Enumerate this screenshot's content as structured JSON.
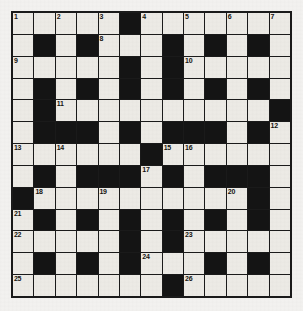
{
  "puzzle": {
    "type": "crossword-grid",
    "rows": 13,
    "columns": 13,
    "colors": {
      "white_cell": "#eceae5",
      "black_cell": "#141414",
      "grid_line": "#1a1a1a",
      "page_background": "#f2f1ef",
      "number_text": "#15130f"
    },
    "cells": [
      [
        {
          "block": false,
          "number": "1"
        },
        {
          "block": false,
          "number": ""
        },
        {
          "block": false,
          "number": "2"
        },
        {
          "block": false,
          "number": ""
        },
        {
          "block": false,
          "number": "3"
        },
        {
          "block": true,
          "number": ""
        },
        {
          "block": false,
          "number": "4"
        },
        {
          "block": false,
          "number": ""
        },
        {
          "block": false,
          "number": "5"
        },
        {
          "block": false,
          "number": ""
        },
        {
          "block": false,
          "number": "6"
        },
        {
          "block": false,
          "number": ""
        },
        {
          "block": false,
          "number": "7"
        }
      ],
      [
        {
          "block": false,
          "number": ""
        },
        {
          "block": true,
          "number": ""
        },
        {
          "block": false,
          "number": ""
        },
        {
          "block": true,
          "number": ""
        },
        {
          "block": false,
          "number": "8"
        },
        {
          "block": false,
          "number": ""
        },
        {
          "block": false,
          "number": ""
        },
        {
          "block": true,
          "number": ""
        },
        {
          "block": false,
          "number": ""
        },
        {
          "block": true,
          "number": ""
        },
        {
          "block": false,
          "number": ""
        },
        {
          "block": true,
          "number": ""
        },
        {
          "block": false,
          "number": ""
        }
      ],
      [
        {
          "block": false,
          "number": "9"
        },
        {
          "block": false,
          "number": ""
        },
        {
          "block": false,
          "number": ""
        },
        {
          "block": false,
          "number": ""
        },
        {
          "block": false,
          "number": ""
        },
        {
          "block": true,
          "number": ""
        },
        {
          "block": false,
          "number": ""
        },
        {
          "block": true,
          "number": ""
        },
        {
          "block": false,
          "number": "10"
        },
        {
          "block": false,
          "number": ""
        },
        {
          "block": false,
          "number": ""
        },
        {
          "block": false,
          "number": ""
        },
        {
          "block": false,
          "number": ""
        }
      ],
      [
        {
          "block": false,
          "number": ""
        },
        {
          "block": true,
          "number": ""
        },
        {
          "block": false,
          "number": ""
        },
        {
          "block": true,
          "number": ""
        },
        {
          "block": false,
          "number": ""
        },
        {
          "block": true,
          "number": ""
        },
        {
          "block": false,
          "number": ""
        },
        {
          "block": true,
          "number": ""
        },
        {
          "block": false,
          "number": ""
        },
        {
          "block": true,
          "number": ""
        },
        {
          "block": false,
          "number": ""
        },
        {
          "block": true,
          "number": ""
        },
        {
          "block": false,
          "number": ""
        }
      ],
      [
        {
          "block": false,
          "number": ""
        },
        {
          "block": true,
          "number": ""
        },
        {
          "block": false,
          "number": "11"
        },
        {
          "block": false,
          "number": ""
        },
        {
          "block": false,
          "number": ""
        },
        {
          "block": false,
          "number": ""
        },
        {
          "block": false,
          "number": ""
        },
        {
          "block": false,
          "number": ""
        },
        {
          "block": false,
          "number": ""
        },
        {
          "block": false,
          "number": ""
        },
        {
          "block": false,
          "number": ""
        },
        {
          "block": false,
          "number": ""
        },
        {
          "block": true,
          "number": ""
        }
      ],
      [
        {
          "block": false,
          "number": ""
        },
        {
          "block": true,
          "number": ""
        },
        {
          "block": true,
          "number": ""
        },
        {
          "block": true,
          "number": ""
        },
        {
          "block": false,
          "number": ""
        },
        {
          "block": true,
          "number": ""
        },
        {
          "block": false,
          "number": ""
        },
        {
          "block": true,
          "number": ""
        },
        {
          "block": true,
          "number": ""
        },
        {
          "block": true,
          "number": ""
        },
        {
          "block": false,
          "number": ""
        },
        {
          "block": true,
          "number": ""
        },
        {
          "block": false,
          "number": "12"
        }
      ],
      [
        {
          "block": false,
          "number": "13"
        },
        {
          "block": false,
          "number": ""
        },
        {
          "block": false,
          "number": "14"
        },
        {
          "block": false,
          "number": ""
        },
        {
          "block": false,
          "number": ""
        },
        {
          "block": false,
          "number": ""
        },
        {
          "block": true,
          "number": ""
        },
        {
          "block": false,
          "number": "15"
        },
        {
          "block": false,
          "number": "16"
        },
        {
          "block": false,
          "number": ""
        },
        {
          "block": false,
          "number": ""
        },
        {
          "block": false,
          "number": ""
        },
        {
          "block": false,
          "number": ""
        }
      ],
      [
        {
          "block": false,
          "number": ""
        },
        {
          "block": true,
          "number": ""
        },
        {
          "block": false,
          "number": ""
        },
        {
          "block": true,
          "number": ""
        },
        {
          "block": true,
          "number": ""
        },
        {
          "block": true,
          "number": ""
        },
        {
          "block": false,
          "number": "17"
        },
        {
          "block": true,
          "number": ""
        },
        {
          "block": false,
          "number": ""
        },
        {
          "block": true,
          "number": ""
        },
        {
          "block": true,
          "number": ""
        },
        {
          "block": true,
          "number": ""
        },
        {
          "block": false,
          "number": ""
        }
      ],
      [
        {
          "block": true,
          "number": ""
        },
        {
          "block": false,
          "number": "18"
        },
        {
          "block": false,
          "number": ""
        },
        {
          "block": false,
          "number": ""
        },
        {
          "block": false,
          "number": "19"
        },
        {
          "block": false,
          "number": ""
        },
        {
          "block": false,
          "number": ""
        },
        {
          "block": false,
          "number": ""
        },
        {
          "block": false,
          "number": ""
        },
        {
          "block": false,
          "number": ""
        },
        {
          "block": false,
          "number": "20"
        },
        {
          "block": true,
          "number": ""
        },
        {
          "block": false,
          "number": ""
        }
      ],
      [
        {
          "block": false,
          "number": "21"
        },
        {
          "block": true,
          "number": ""
        },
        {
          "block": false,
          "number": ""
        },
        {
          "block": true,
          "number": ""
        },
        {
          "block": false,
          "number": ""
        },
        {
          "block": true,
          "number": ""
        },
        {
          "block": false,
          "number": ""
        },
        {
          "block": true,
          "number": ""
        },
        {
          "block": false,
          "number": ""
        },
        {
          "block": true,
          "number": ""
        },
        {
          "block": false,
          "number": ""
        },
        {
          "block": true,
          "number": ""
        },
        {
          "block": false,
          "number": ""
        }
      ],
      [
        {
          "block": false,
          "number": "22"
        },
        {
          "block": false,
          "number": ""
        },
        {
          "block": false,
          "number": ""
        },
        {
          "block": false,
          "number": ""
        },
        {
          "block": false,
          "number": ""
        },
        {
          "block": true,
          "number": ""
        },
        {
          "block": false,
          "number": ""
        },
        {
          "block": true,
          "number": ""
        },
        {
          "block": false,
          "number": "23"
        },
        {
          "block": false,
          "number": ""
        },
        {
          "block": false,
          "number": ""
        },
        {
          "block": false,
          "number": ""
        },
        {
          "block": false,
          "number": ""
        }
      ],
      [
        {
          "block": false,
          "number": ""
        },
        {
          "block": true,
          "number": ""
        },
        {
          "block": false,
          "number": ""
        },
        {
          "block": true,
          "number": ""
        },
        {
          "block": false,
          "number": ""
        },
        {
          "block": true,
          "number": ""
        },
        {
          "block": false,
          "number": "24"
        },
        {
          "block": false,
          "number": ""
        },
        {
          "block": false,
          "number": ""
        },
        {
          "block": true,
          "number": ""
        },
        {
          "block": false,
          "number": ""
        },
        {
          "block": true,
          "number": ""
        },
        {
          "block": false,
          "number": ""
        }
      ],
      [
        {
          "block": false,
          "number": "25"
        },
        {
          "block": false,
          "number": ""
        },
        {
          "block": false,
          "number": ""
        },
        {
          "block": false,
          "number": ""
        },
        {
          "block": false,
          "number": ""
        },
        {
          "block": false,
          "number": ""
        },
        {
          "block": false,
          "number": ""
        },
        {
          "block": true,
          "number": ""
        },
        {
          "block": false,
          "number": "26"
        },
        {
          "block": false,
          "number": ""
        },
        {
          "block": false,
          "number": ""
        },
        {
          "block": false,
          "number": ""
        },
        {
          "block": false,
          "number": ""
        }
      ]
    ]
  }
}
